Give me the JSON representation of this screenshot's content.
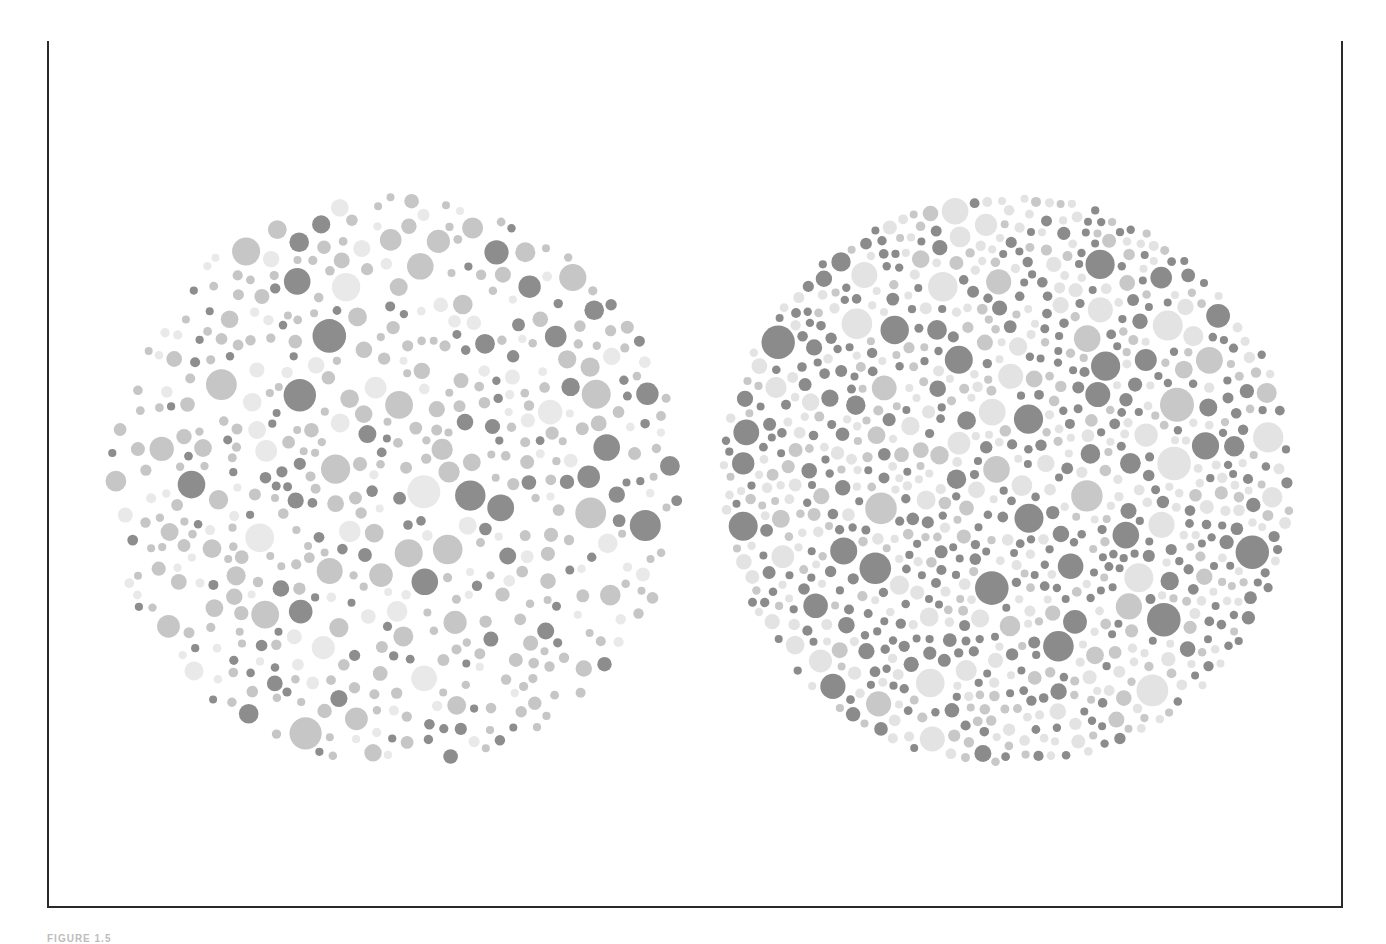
{
  "figure": {
    "caption": "FIGURE 1.5",
    "frame": {
      "border_color": "#2a2a2a",
      "top_bar_color": "#111111",
      "background": "#ffffff"
    }
  },
  "plates": [
    {
      "name": "left-plate",
      "description": "Sparse dot plate, medium-grey field with scattered dark dots",
      "center": [
        295,
        305
      ],
      "radius": 290,
      "dot_count": 520,
      "seed": 17,
      "radius_range": [
        4,
        17
      ],
      "palette": [
        {
          "color": "#c6c6c6",
          "weight": 0.55
        },
        {
          "color": "#e9e9e9",
          "weight": 0.22
        },
        {
          "color": "#8d8d8d",
          "weight": 0.23
        }
      ]
    },
    {
      "name": "right-plate",
      "description": "Dense dot plate, dark and light dots interleaved",
      "center": [
        295,
        305
      ],
      "radius": 288,
      "dot_count": 900,
      "seed": 41,
      "radius_range": [
        4,
        17
      ],
      "palette": [
        {
          "color": "#8b8b8b",
          "weight": 0.44
        },
        {
          "color": "#c8c8c8",
          "weight": 0.22
        },
        {
          "color": "#e3e3e3",
          "weight": 0.34
        }
      ]
    }
  ]
}
